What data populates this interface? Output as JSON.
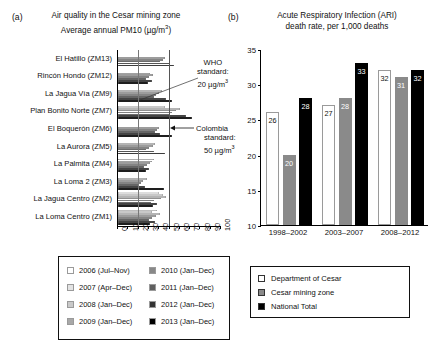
{
  "panel_a": {
    "letter": "(a)",
    "title_line1": "Air quality in the Cesar mining zone",
    "title_line2": "Average annual PM10 (µg/m³)",
    "who_note": "WHO\nstandard:\n20 µg/m³",
    "who_line1": "WHO",
    "who_line2": "standard:",
    "who_line3": "20 µg/m³",
    "col_line1": "Colombia",
    "col_line2": "standard:",
    "col_line3": "50 µg/m³",
    "legend": [
      {
        "label": "2006 (Jul–Nov)",
        "color": "#ffffff"
      },
      {
        "label": "2007 (Apr–Dec)",
        "color": "#e3e3e3"
      },
      {
        "label": "2008 (Jan–Dec)",
        "color": "#c9c9c9"
      },
      {
        "label": "2009 (Jan–Dec)",
        "color": "#a8a8a8"
      },
      {
        "label": "2010 (Jan–Dec)",
        "color": "#888888"
      },
      {
        "label": "2011 (Jan–Dec)",
        "color": "#5f5f5f"
      },
      {
        "label": "2012 (Jan–Dec)",
        "color": "#333333"
      },
      {
        "label": "2013 (Jan–Dec)",
        "color": "#000000"
      }
    ]
  },
  "panel_b": {
    "letter": "(b)",
    "title_line1": "Acute Respiratory Infection (ARI)",
    "title_line2": "death rate, per 1,000 deaths",
    "legend": [
      {
        "label": "Department of Cesar",
        "color": "#ffffff"
      },
      {
        "label": "Cesar mining zone",
        "color": "#8a8a8a"
      },
      {
        "label": "National Total",
        "color": "#000000"
      }
    ]
  },
  "chart_data": [
    {
      "type": "bar",
      "orientation": "horizontal",
      "title": "Air quality in the Cesar mining zone — Average annual PM10 (µg/m³)",
      "xlabel": "",
      "ylabel": "",
      "xlim": [
        0,
        100
      ],
      "xticks": [
        0,
        10,
        20,
        30,
        40,
        50,
        60,
        70,
        80,
        90,
        100
      ],
      "grid": false,
      "legend_position": "bottom",
      "reference_lines": [
        {
          "label": "WHO standard",
          "value": 20,
          "units": "µg/m³"
        },
        {
          "label": "Colombia standard",
          "value": 50,
          "units": "µg/m³"
        }
      ],
      "categories": [
        "El Hatillo (ZM13)",
        "Rincón Hondo (ZM12)",
        "La Jagua Vía (ZM9)",
        "Plan Bonito Norte (ZM7)",
        "El Boquerón (ZM6)",
        "La Aurora (ZM5)",
        "La Palmita (ZM4)",
        "La Loma 2 (ZM3)",
        "La Jagua Centro (ZM2)",
        "La Loma Centro (ZM1)"
      ],
      "series": [
        {
          "name": "2006 (Jul–Nov)",
          "color": "#ffffff",
          "values": [
            null,
            null,
            null,
            null,
            null,
            null,
            null,
            null,
            40,
            38
          ]
        },
        {
          "name": "2007 (Apr–Dec)",
          "color": "#e3e3e3",
          "values": [
            null,
            null,
            null,
            46,
            null,
            null,
            35,
            null,
            44,
            33
          ]
        },
        {
          "name": "2008 (Jan–Dec)",
          "color": "#c9c9c9",
          "values": [
            null,
            31,
            43,
            60,
            null,
            36,
            33,
            28,
            47,
            41
          ]
        },
        {
          "name": "2009 (Jan–Dec)",
          "color": "#a8a8a8",
          "values": [
            46,
            34,
            40,
            56,
            40,
            34,
            31,
            24,
            42,
            37
          ]
        },
        {
          "name": "2010 (Jan–Dec)",
          "color": "#888888",
          "values": [
            44,
            30,
            37,
            52,
            38,
            30,
            28,
            22,
            35,
            33
          ]
        },
        {
          "name": "2011 (Jan–Dec)",
          "color": "#5f5f5f",
          "values": [
            41,
            27,
            35,
            50,
            36,
            27,
            25,
            20,
            32,
            30
          ]
        },
        {
          "name": "2012 (Jan–Dec)",
          "color": "#333333",
          "values": [
            50,
            33,
            47,
            66,
            41,
            35,
            30,
            26,
            38,
            36
          ]
        },
        {
          "name": "2013 (Jan–Dec)",
          "color": "#000000",
          "values": [
            54,
            29,
            52,
            72,
            52,
            46,
            27,
            45,
            34,
            31
          ]
        }
      ]
    },
    {
      "type": "bar",
      "orientation": "vertical",
      "title": "Acute Respiratory Infection (ARI) death rate, per 1,000 deaths",
      "xlabel": "",
      "ylabel": "",
      "ylim": [
        10,
        35
      ],
      "yticks": [
        10,
        15,
        20,
        25,
        30,
        35
      ],
      "grid": false,
      "legend_position": "bottom",
      "categories": [
        "1998–2002",
        "2003–2007",
        "2008–2012"
      ],
      "series": [
        {
          "name": "Department of Cesar",
          "color": "#ffffff",
          "values": [
            26,
            27,
            32
          ]
        },
        {
          "name": "Cesar mining zone",
          "color": "#8a8a8a",
          "values": [
            20,
            28,
            31
          ]
        },
        {
          "name": "National Total",
          "color": "#000000",
          "values": [
            28,
            33,
            32
          ]
        }
      ]
    }
  ]
}
